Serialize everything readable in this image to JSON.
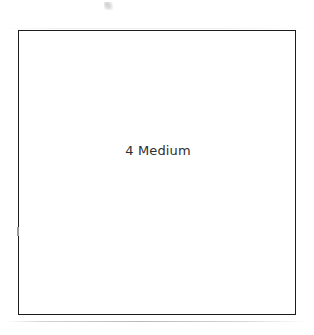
{
  "page": {
    "background_color": "#ffffff",
    "width": 314,
    "height": 335
  },
  "box": {
    "label": "4 Medium",
    "border_color": "#1c1c1c",
    "fill_color": "#ffffff",
    "text_color": "#2e2e2e"
  },
  "artifacts": {
    "speck_name": "scan-speck",
    "baseline_name": "scan-baseline-streak",
    "topline_name": "scan-top-streak"
  }
}
